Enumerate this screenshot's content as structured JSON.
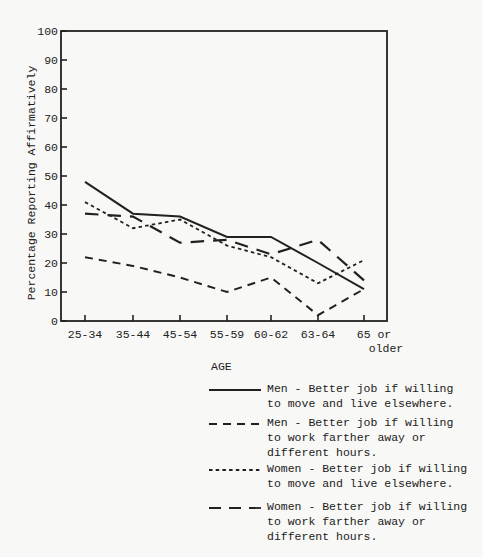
{
  "page": {
    "background": "#f8f8f6",
    "ink": "#212121"
  },
  "chart_data": {
    "type": "line",
    "title": "",
    "xlabel": "AGE",
    "ylabel": "Percentage Reporting Affirmatively",
    "categories": [
      "25-34",
      "35-44",
      "45-54",
      "55-59",
      "60-62",
      "63-64",
      "65 or older"
    ],
    "x_tick_display": [
      "25-34",
      "35-44",
      "45-54",
      "55-59",
      "60-62",
      "63-64",
      "65 or\nolder"
    ],
    "ylim": [
      0,
      100
    ],
    "ytick_step": 10,
    "grid": false,
    "legend_position": "below right",
    "series": [
      {
        "id": "men-move",
        "style": "solid",
        "name": "Men - Better job if willing to move and live elsewhere.",
        "values": [
          48,
          37,
          36,
          29,
          29,
          20,
          11
        ]
      },
      {
        "id": "men-work",
        "style": "medium-dash",
        "name": "Men - Better job if willing to work farther away or different hours.",
        "values": [
          22,
          19,
          15,
          10,
          15,
          2,
          11
        ]
      },
      {
        "id": "women-move",
        "style": "short-dash",
        "name": "Women - Better job if willing to move and live elsewhere.",
        "values": [
          41,
          32,
          35,
          26,
          22,
          13,
          21
        ]
      },
      {
        "id": "women-work",
        "style": "long-dash",
        "name": "Women - Better job if willing to work farther away or different hours.",
        "values": [
          37,
          36,
          27,
          28,
          23,
          28,
          14
        ]
      }
    ]
  },
  "legend": {
    "entries": [
      {
        "style": "solid",
        "line1": "Men - Better job if willing",
        "line2": "to move and live elsewhere.",
        "line3": ""
      },
      {
        "style": "medium-dash",
        "line1": "Men - Better job if willing",
        "line2": "to work farther away or",
        "line3": "different hours."
      },
      {
        "style": "short-dash",
        "line1": "Women - Better job if willing",
        "line2": "to move and live elsewhere.",
        "line3": ""
      },
      {
        "style": "long-dash",
        "line1": "Women - Better job if willing",
        "line2": "to work farther away or",
        "line3": "different hours."
      }
    ]
  }
}
